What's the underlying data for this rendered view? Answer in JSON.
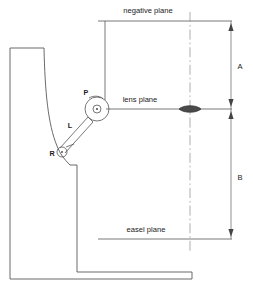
{
  "diagram": {
    "planes": [
      {
        "id": "negative",
        "label": "negative plane",
        "y": 21,
        "x_start": 98,
        "x_end": 232,
        "label_x": 148,
        "label_y": 13
      },
      {
        "id": "lens",
        "label": "lens plane",
        "y": 109,
        "x_start": 106,
        "x_end": 232,
        "label_x": 140,
        "label_y": 102
      },
      {
        "id": "easel",
        "label": "easel plane",
        "y": 239,
        "x_start": 98,
        "x_end": 232,
        "label_x": 146,
        "label_y": 232
      }
    ],
    "dimensions": [
      {
        "id": "A",
        "label": "A",
        "from_plane": "negative",
        "from_y": 21,
        "to_y": 109,
        "label_x": 240,
        "label_y": 69
      },
      {
        "id": "B",
        "label": "B",
        "from_plane": "lens",
        "from_y": 109,
        "to_y": 239,
        "label_x": 240,
        "label_y": 180
      }
    ],
    "dimension_line_x": 231,
    "centerline": {
      "x": 190,
      "y_top": 12,
      "y_bottom": 252,
      "style": "dash-dot"
    },
    "lens_element": {
      "cx": 190,
      "cy": 109,
      "rx": 11,
      "ry": 4
    },
    "points": [
      {
        "id": "P",
        "label": "P",
        "cx": 97,
        "cy": 109,
        "r": 12,
        "label_x": 86,
        "label_y": 95
      },
      {
        "id": "R",
        "label": "R",
        "cx": 62,
        "cy": 152,
        "r": 5,
        "label_x": 52,
        "label_y": 156
      }
    ],
    "links": [
      {
        "id": "L",
        "label": "L",
        "from": "P",
        "to": "R",
        "label_x": 70,
        "label_y": 128
      }
    ],
    "colors": {
      "line": "#555555",
      "body": "#5a5a5a",
      "dimension": "#777777",
      "centerline": "#9a9a9a",
      "lens_fill": "#4a4a4a",
      "text": "#1a1a1a",
      "background": "#ffffff"
    }
  }
}
